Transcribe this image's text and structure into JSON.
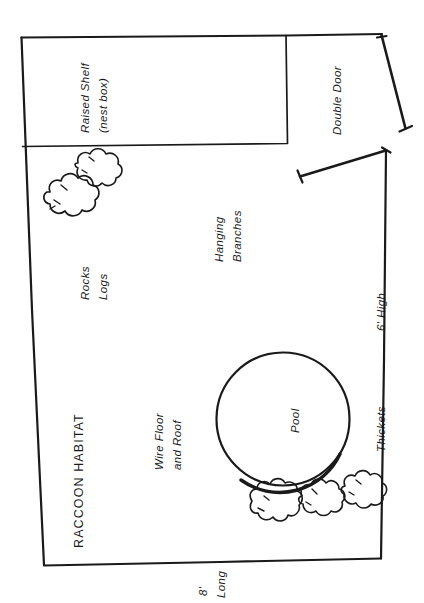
{
  "diagram": {
    "title": "RACCOON HABITAT",
    "type": "hand-drawn enclosure floor plan",
    "orientation_note": "All labels rendered rotated 90 degrees (reading bottom-to-top)",
    "labels": {
      "title": "RACCOON HABITAT",
      "raised_shelf_line1": "Raised Shelf",
      "raised_shelf_line2": "(nest box)",
      "double_door": "Double Door",
      "rocks": "Rocks",
      "logs": "Logs",
      "hanging_line1": "Hanging",
      "hanging_line2": "Branches",
      "wire_line1": "Wire Floor",
      "wire_line2": "and Roof",
      "pool": "Pool",
      "thickets": "Thickets",
      "height_dim": "6' High",
      "length_dim_line1": "8'",
      "length_dim_line2": "Long"
    },
    "dimensions": {
      "height": "6' High",
      "length": "8' Long"
    },
    "features": [
      "Raised Shelf (nest box)",
      "Double Door",
      "Rocks",
      "Logs",
      "Hanging Branches",
      "Wire Floor and Roof",
      "Pool",
      "Thickets"
    ],
    "colors": {
      "ink": "#1a1a1a",
      "paper": "#ffffff"
    },
    "shapes": {
      "bush_top_left_count": 2,
      "bush_pool_count": 3,
      "pool_shape": "circle",
      "nest_box_shape": "rectangle",
      "door_panels": 2
    }
  }
}
